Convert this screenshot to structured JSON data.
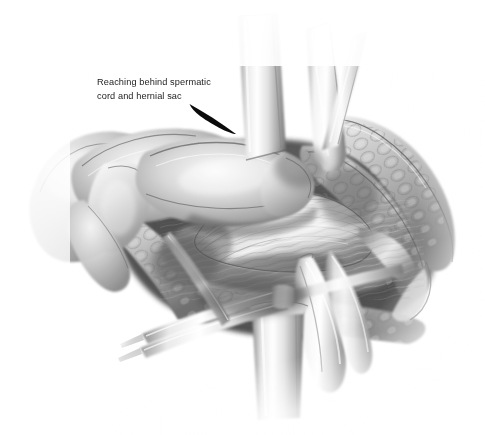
{
  "figure": {
    "kind": "surgical-illustration",
    "medium": "graphite pencil drawing, grayscale",
    "background_color": "#ffffff"
  },
  "caption": {
    "line1": "Reaching behind spermatic",
    "line2": "cord and hernial sac",
    "color": "#1c1c1c"
  },
  "leader_line": {
    "name": "caption-leader-line",
    "color": "#0b0b0b",
    "from_x": 189,
    "from_y": 104,
    "to_x": 236,
    "to_y": 134,
    "style": "tapered solid stroke, thin at origin, thick at tip"
  },
  "palette": {
    "paper": "#ffffff",
    "lightest_tissue": "#f2f2f2",
    "mid_tissue": "#b8b8b8",
    "deep_shadow": "#4a4a4a",
    "darkest": "#2b2b2b",
    "metal_highlight": "#fdfdfd",
    "metal_shade": "#9e9e9e"
  },
  "elements": [
    {
      "name": "surgeons-hand",
      "label": "Surgeon's gloved hand and fingers",
      "region": "left-center"
    },
    {
      "name": "index-finger",
      "label": "Index finger reaching into wound",
      "region": "upper-left-center"
    },
    {
      "name": "spermatic-cord",
      "label": "Spermatic cord with hernial sac",
      "region": "center"
    },
    {
      "name": "wound-edge-right",
      "label": "Retracted wound edge with subcutaneous fat",
      "region": "right"
    },
    {
      "name": "wound-edge-lower",
      "label": "Retracted wound edge, lower margin",
      "region": "bottom-center"
    },
    {
      "name": "retractor-top",
      "label": "Flat blade retractor, vertical",
      "region": "top-center"
    },
    {
      "name": "retractor-upper-right",
      "label": "Angled blade retractor",
      "region": "upper-right"
    },
    {
      "name": "retractor-bottom",
      "label": "Broad band retractor",
      "region": "bottom-center"
    },
    {
      "name": "retractor-lower-right",
      "label": "Curved blade retractor",
      "region": "lower-right"
    },
    {
      "name": "forceps",
      "label": "Forceps / hemostat tips",
      "region": "lower-left-center"
    }
  ]
}
